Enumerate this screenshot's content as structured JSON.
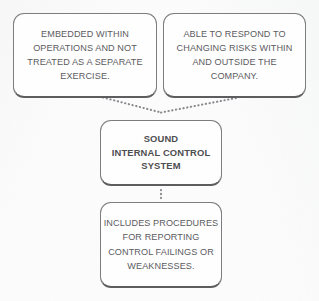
{
  "diagram": {
    "type": "flow-diagram",
    "title": "Sound Internal Control System",
    "background_color": "#fcfcfc",
    "node_border_color": "#7d7d80",
    "node_shadow_color": "#5d5d60",
    "text_color": "#5b5b5e",
    "connector_color": "#8a8a8d",
    "connector_style": "dotted",
    "nodes": [
      {
        "id": "embedded",
        "role": "attribute-top-left",
        "lines": [
          "EMBEDDED WITHIN",
          "OPERATIONS AND NOT",
          "TREATED AS A SEPARATE",
          "EXERCISE."
        ]
      },
      {
        "id": "respond",
        "role": "attribute-top-right",
        "lines": [
          "ABLE TO RESPOND TO",
          "CHANGING RISKS WITHIN",
          "AND OUTSIDE THE",
          "COMPANY."
        ]
      },
      {
        "id": "core",
        "role": "central-concept",
        "emphasis": "bold",
        "lines": [
          "SOUND",
          "INTERNAL CONTROL",
          "SYSTEM"
        ]
      },
      {
        "id": "procedures",
        "role": "attribute-bottom",
        "lines": [
          "INCLUDES PROCEDURES",
          "FOR REPORTING",
          "CONTROL FAILINGS OR",
          "WEAKNESSES."
        ]
      }
    ],
    "connectors": [
      {
        "id": "embedded-to-core",
        "from": "embedded",
        "to": "core"
      },
      {
        "id": "respond-to-core",
        "from": "respond",
        "to": "core"
      },
      {
        "id": "core-to-procedures",
        "from": "core",
        "to": "procedures"
      }
    ]
  }
}
